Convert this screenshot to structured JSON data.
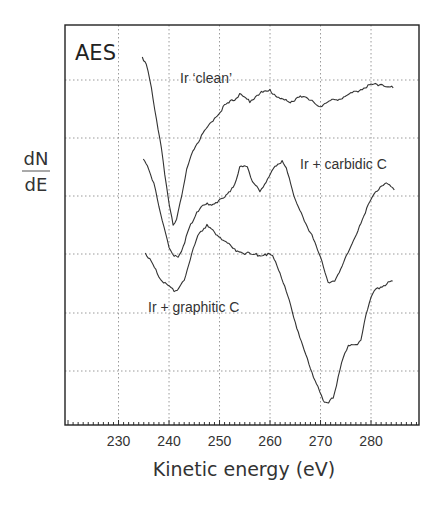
{
  "chart_data": {
    "type": "line",
    "title": "AES",
    "xlabel": "Kinetic energy (eV)",
    "ylabel_numerator": "dN",
    "ylabel_denominator": "dE",
    "xlim": [
      219.4,
      289.5
    ],
    "x_ticks": [
      230,
      240,
      250,
      260,
      270,
      280
    ],
    "x_tick_labels": [
      "230",
      "240",
      "250",
      "260",
      "270",
      "280"
    ],
    "y_ticks_labeled": false,
    "grid": true,
    "legend": "inline annotations",
    "series": [
      {
        "name": "Ir 'clean'",
        "label": "Ir ‘clean’",
        "x": [
          234.7,
          235.5,
          236.5,
          237.5,
          238.5,
          239.5,
          240.3,
          240.8,
          241.5,
          242.5,
          243.5,
          245,
          247,
          249,
          251,
          253,
          254,
          256,
          258,
          260,
          262,
          264,
          266,
          268,
          270,
          272,
          274,
          276,
          278,
          280,
          282,
          284.4
        ],
        "y_px": [
          57,
          64,
          88,
          118,
          150,
          185,
          212,
          225,
          220,
          196,
          170,
          148,
          132,
          118,
          106,
          99,
          95,
          101,
          93,
          91,
          98,
          103,
          95,
          101,
          106,
          101,
          98,
          94,
          89,
          85,
          84,
          88
        ]
      },
      {
        "name": "Ir + carbidic C",
        "label": "Ir + carbidic C",
        "x": [
          234.9,
          236,
          237,
          238,
          239,
          240,
          241,
          241.8,
          242.8,
          244,
          245.5,
          247,
          249,
          251,
          253,
          254,
          255.5,
          256.5,
          258,
          259.5,
          261,
          262.4,
          263.5,
          265,
          266.5,
          268,
          270,
          271.5,
          272.8,
          274,
          276,
          278,
          280,
          281.8,
          283,
          284.6
        ],
        "y_px": [
          160,
          168,
          184,
          206,
          228,
          247,
          256,
          258,
          246,
          228,
          212,
          205,
          203,
          198,
          184,
          168,
          166,
          182,
          191,
          180,
          166,
          161,
          172,
          200,
          218,
          232,
          258,
          282,
          282,
          268,
          248,
          222,
          200,
          186,
          183,
          190
        ]
      },
      {
        "name": "Ir + graphitic C",
        "label": "Ir + graphitic C",
        "x": [
          235.3,
          236.5,
          238,
          239.5,
          241,
          242,
          243,
          244.5,
          246,
          247.5,
          249,
          251,
          253,
          255,
          257,
          259,
          260.5,
          262,
          263.5,
          265,
          266.5,
          268,
          269.5,
          270.5,
          271.6,
          272.5,
          273.5,
          274.5,
          275.5,
          277,
          278,
          279,
          280,
          281,
          282.5,
          284.3
        ],
        "y_px": [
          253,
          262,
          276,
          285,
          291,
          289,
          280,
          254,
          232,
          226,
          232,
          241,
          250,
          253,
          255,
          254,
          256,
          272,
          296,
          322,
          347,
          368,
          388,
          400,
          403,
          398,
          378,
          356,
          346,
          345,
          340,
          316,
          296,
          289,
          285,
          281
        ]
      }
    ],
    "annotations": [
      {
        "text": "AES",
        "position": "top-left inside frame"
      },
      {
        "text": "Ir ‘clean’",
        "near_series": "Ir 'clean'"
      },
      {
        "text": "Ir + carbidic C",
        "near_series": "Ir + carbidic C"
      },
      {
        "text": "Ir + graphitic C",
        "near_series": "Ir + graphitic C"
      }
    ]
  },
  "labels": {
    "title": "AES",
    "clean": "Ir ‘clean’",
    "carbidic": "Ir + carbidic C",
    "graphitic": "Ir + graphitic C",
    "ylabel_top": "dN",
    "ylabel_bottom": "dE",
    "xlabel": "Kinetic energy (eV)",
    "ticks": [
      "230",
      "240",
      "250",
      "260",
      "270",
      "280"
    ]
  }
}
